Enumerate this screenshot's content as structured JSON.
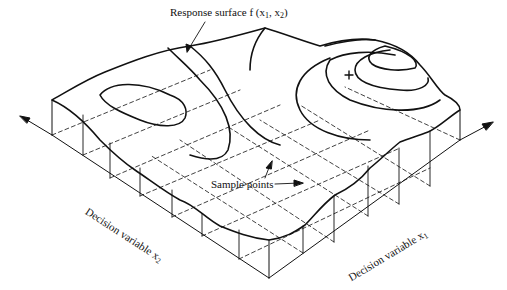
{
  "figure": {
    "title_label": {
      "text": "Response surface f (x",
      "sub1": "1",
      "mid": ", x",
      "sub2": "2",
      "end": ")"
    },
    "sample_label": "Sample points",
    "axis_x1": {
      "text": "Decision variable x",
      "sub": "1"
    },
    "axis_x2": {
      "text": "Decision variable x",
      "sub": "2"
    },
    "maximum_marker": "+",
    "colors": {
      "line": "#111111",
      "background": "#ffffff"
    }
  }
}
